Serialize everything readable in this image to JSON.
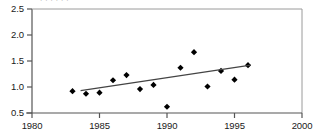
{
  "chart_data": {
    "type": "scatter",
    "title": "",
    "subtitle": "",
    "xlabel": "",
    "ylabel": "",
    "xlim": [
      1980,
      2000
    ],
    "ylim": [
      0.5,
      2.5
    ],
    "x_ticks": [
      1980,
      1985,
      1990,
      1995,
      2000
    ],
    "x_tick_labels": [
      "1980",
      "1985",
      "1990",
      "1995",
      "2000"
    ],
    "y_ticks": [
      0.5,
      1.0,
      1.5,
      2.0,
      2.5
    ],
    "y_tick_labels": [
      "0.5",
      "1.0",
      "1.5",
      "2.0",
      "2.5"
    ],
    "grid": false,
    "legend": "none",
    "series": [
      {
        "name": "observations",
        "marker": "diamond",
        "color": "#000000",
        "x": [
          1983,
          1984,
          1985,
          1986,
          1987,
          1988,
          1989,
          1990,
          1991,
          1992,
          1993,
          1994,
          1995,
          1996
        ],
        "values": [
          0.92,
          0.87,
          0.89,
          1.13,
          1.23,
          0.96,
          1.04,
          0.62,
          1.37,
          1.67,
          1.01,
          1.31,
          1.14,
          1.42
        ]
      },
      {
        "name": "trend-line",
        "marker": "none",
        "color": "#444444",
        "x": [
          1983.6,
          1996.2
        ],
        "values": [
          0.93,
          1.42
        ]
      }
    ],
    "annotations": []
  },
  "axes": {
    "y_axis_name": "value-axis",
    "x_axis_name": "year-axis"
  },
  "clipped_header": {
    "text": ". . . . . ."
  }
}
